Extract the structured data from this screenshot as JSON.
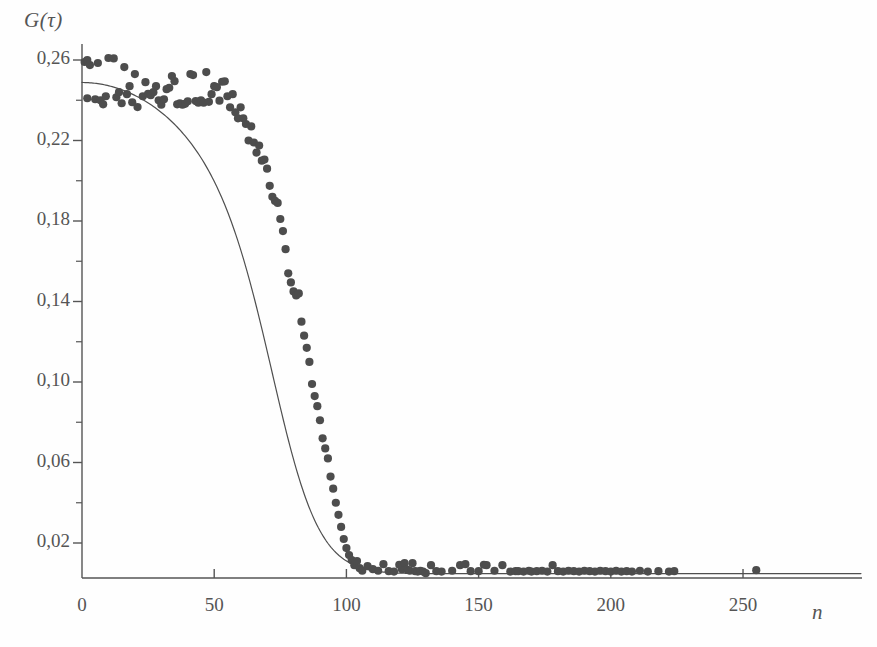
{
  "figure": {
    "background_color": "#fefefe",
    "ink_color": "#555555",
    "marker_color": "#4d4d4d",
    "curve_color": "#4f4f4f"
  },
  "chart_data": {
    "type": "scatter",
    "title": "",
    "xlabel": "n",
    "ylabel": "G(τ)",
    "xlim": [
      0,
      295
    ],
    "ylim": [
      0.0,
      0.272
    ],
    "grid": false,
    "legend": null,
    "decimal_separator": ",",
    "x_ticks": [
      0,
      50,
      100,
      150,
      200,
      250
    ],
    "x_tick_labels": [
      "0",
      "50",
      "100",
      "150",
      "200",
      "250"
    ],
    "y_ticks": [
      0.02,
      0.06,
      0.1,
      0.14,
      0.18,
      0.22,
      0.26
    ],
    "y_tick_labels": [
      "0,02",
      "0,06",
      "0,10",
      "0,14",
      "0,18",
      "0,22",
      "0,26"
    ],
    "y_minor_ticks": [
      0.04,
      0.08,
      0.12,
      0.16,
      0.2,
      0.24
    ],
    "series": [
      {
        "name": "measured G(tau)",
        "type": "scatter",
        "marker": "filled-circle",
        "marker_size": 5,
        "color": "#4d4d4d",
        "points": [
          [
            1,
            0.259
          ],
          [
            2,
            0.26
          ],
          [
            2,
            0.241
          ],
          [
            3,
            0.2575
          ],
          [
            5,
            0.2405
          ],
          [
            6,
            0.2585
          ],
          [
            7,
            0.24
          ],
          [
            8,
            0.238
          ],
          [
            9,
            0.242
          ],
          [
            10,
            0.261
          ],
          [
            12,
            0.2608
          ],
          [
            13,
            0.2415
          ],
          [
            14,
            0.244
          ],
          [
            15,
            0.2385
          ],
          [
            16,
            0.2565
          ],
          [
            17,
            0.243
          ],
          [
            18,
            0.247
          ],
          [
            19,
            0.239
          ],
          [
            20,
            0.253
          ],
          [
            21,
            0.2366
          ],
          [
            23,
            0.242
          ],
          [
            24,
            0.249
          ],
          [
            25,
            0.2432
          ],
          [
            26,
            0.2425
          ],
          [
            27,
            0.244
          ],
          [
            28,
            0.247
          ],
          [
            29,
            0.24
          ],
          [
            30,
            0.2378
          ],
          [
            31,
            0.2405
          ],
          [
            32,
            0.2455
          ],
          [
            33,
            0.2462
          ],
          [
            34,
            0.252
          ],
          [
            35,
            0.2495
          ],
          [
            36,
            0.238
          ],
          [
            37,
            0.2385
          ],
          [
            38,
            0.2378
          ],
          [
            39,
            0.2382
          ],
          [
            40,
            0.2395
          ],
          [
            41,
            0.253
          ],
          [
            42,
            0.2525
          ],
          [
            43,
            0.2396
          ],
          [
            44,
            0.2388
          ],
          [
            45,
            0.24
          ],
          [
            46,
            0.2388
          ],
          [
            47,
            0.254
          ],
          [
            48,
            0.2392
          ],
          [
            49,
            0.243
          ],
          [
            50,
            0.247
          ],
          [
            51,
            0.2465
          ],
          [
            52,
            0.2398
          ],
          [
            53,
            0.2492
          ],
          [
            54,
            0.2494
          ],
          [
            55,
            0.242
          ],
          [
            56,
            0.2365
          ],
          [
            57,
            0.243
          ],
          [
            58,
            0.234
          ],
          [
            59,
            0.231
          ],
          [
            60,
            0.2365
          ],
          [
            61,
            0.231
          ],
          [
            62,
            0.2282
          ],
          [
            63,
            0.22
          ],
          [
            64,
            0.227
          ],
          [
            65,
            0.219
          ],
          [
            66,
            0.214
          ],
          [
            67,
            0.2175
          ],
          [
            68,
            0.21
          ],
          [
            69,
            0.2105
          ],
          [
            70,
            0.206
          ],
          [
            71,
            0.1975
          ],
          [
            72,
            0.192
          ],
          [
            73,
            0.19
          ],
          [
            74,
            0.189
          ],
          [
            75,
            0.181
          ],
          [
            76,
            0.175
          ],
          [
            77,
            0.166
          ],
          [
            78,
            0.154
          ],
          [
            79,
            0.1495
          ],
          [
            80,
            0.145
          ],
          [
            81,
            0.143
          ],
          [
            82,
            0.144
          ],
          [
            83,
            0.13
          ],
          [
            84,
            0.123
          ],
          [
            85,
            0.117
          ],
          [
            86,
            0.11
          ],
          [
            87,
            0.099
          ],
          [
            88,
            0.093
          ],
          [
            89,
            0.088
          ],
          [
            90,
            0.081
          ],
          [
            91,
            0.072
          ],
          [
            92,
            0.067
          ],
          [
            93,
            0.062
          ],
          [
            94,
            0.053
          ],
          [
            95,
            0.047
          ],
          [
            96,
            0.04
          ],
          [
            97,
            0.034
          ],
          [
            98,
            0.028
          ],
          [
            99,
            0.022
          ],
          [
            100,
            0.0175
          ],
          [
            101,
            0.014
          ],
          [
            102,
            0.0115
          ],
          [
            103,
            0.009
          ],
          [
            104,
            0.011
          ],
          [
            105,
            0.0075
          ],
          [
            106,
            0.0062
          ],
          [
            108,
            0.0085
          ],
          [
            110,
            0.007
          ],
          [
            112,
            0.0062
          ],
          [
            114,
            0.0095
          ],
          [
            116,
            0.006
          ],
          [
            118,
            0.0058
          ],
          [
            120,
            0.0092
          ],
          [
            121,
            0.007
          ],
          [
            122,
            0.01
          ],
          [
            123,
            0.0068
          ],
          [
            124,
            0.0062
          ],
          [
            125,
            0.01
          ],
          [
            126,
            0.006
          ],
          [
            127,
            0.0058
          ],
          [
            128,
            0.0062
          ],
          [
            129,
            0.0058
          ],
          [
            130,
            0.005
          ],
          [
            132,
            0.009
          ],
          [
            134,
            0.006
          ],
          [
            136,
            0.0058
          ],
          [
            140,
            0.0062
          ],
          [
            143,
            0.009
          ],
          [
            145,
            0.0095
          ],
          [
            147,
            0.006
          ],
          [
            150,
            0.006
          ],
          [
            152,
            0.0092
          ],
          [
            153,
            0.009
          ],
          [
            156,
            0.0062
          ],
          [
            159,
            0.009
          ],
          [
            162,
            0.0058
          ],
          [
            164,
            0.006
          ],
          [
            165,
            0.006
          ],
          [
            167,
            0.0058
          ],
          [
            169,
            0.0062
          ],
          [
            170,
            0.0058
          ],
          [
            172,
            0.006
          ],
          [
            174,
            0.0062
          ],
          [
            176,
            0.0058
          ],
          [
            178,
            0.009
          ],
          [
            180,
            0.006
          ],
          [
            182,
            0.0058
          ],
          [
            184,
            0.0062
          ],
          [
            186,
            0.006
          ],
          [
            188,
            0.0058
          ],
          [
            190,
            0.0062
          ],
          [
            192,
            0.006
          ],
          [
            194,
            0.0058
          ],
          [
            196,
            0.0062
          ],
          [
            198,
            0.006
          ],
          [
            200,
            0.0058
          ],
          [
            202,
            0.0062
          ],
          [
            204,
            0.0058
          ],
          [
            206,
            0.006
          ],
          [
            208,
            0.0058
          ],
          [
            211,
            0.0062
          ],
          [
            214,
            0.0058
          ],
          [
            218,
            0.006
          ],
          [
            222,
            0.0058
          ],
          [
            224,
            0.006
          ],
          [
            255,
            0.0065
          ]
        ]
      },
      {
        "name": "fitted curve",
        "type": "line",
        "color": "#4f4f4f",
        "linewidth": 1.2,
        "model": "plateau-sigmoid",
        "plateau": 0.2489,
        "baseline": 0.0048,
        "midpoint_n": 75.5,
        "width_n": 9.2,
        "slow_decay_start": 0.2489,
        "slow_decay_at_50": 0.2452
      }
    ]
  }
}
